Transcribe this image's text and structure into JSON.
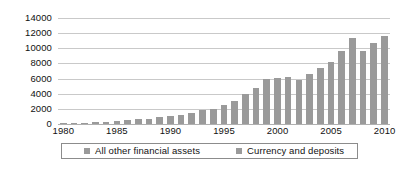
{
  "chart_data": {
    "type": "bar",
    "title": "",
    "subtitle": "",
    "xlabel": "",
    "ylabel": "",
    "ylim": [
      0,
      14000
    ],
    "y_ticks": [
      0,
      2000,
      4000,
      6000,
      8000,
      10000,
      12000,
      14000
    ],
    "x_tick_labels": [
      "1980",
      "1985",
      "1990",
      "1995",
      "2000",
      "2005",
      "2010"
    ],
    "x_tick_years": [
      1980,
      1985,
      1990,
      1995,
      2000,
      2005,
      2010
    ],
    "grid": true,
    "legend_position": "bottom",
    "legend": [
      "All other financial assets",
      "Currency and deposits"
    ],
    "categories": [
      "1980",
      "1981",
      "1982",
      "1983",
      "1984",
      "1985",
      "1986",
      "1987",
      "1988",
      "1989",
      "1990",
      "1991",
      "1992",
      "1993",
      "1994",
      "1995",
      "1996",
      "1997",
      "1998",
      "1999",
      "2000",
      "2001",
      "2002",
      "2003",
      "2004",
      "2005",
      "2006",
      "2007",
      "2008",
      "2009",
      "2010"
    ],
    "series": [
      {
        "name": "All other financial assets",
        "color": "#9a9a9a",
        "values": [
          60,
          120,
          170,
          230,
          300,
          380,
          560,
          640,
          700,
          950,
          1050,
          1250,
          1500,
          1900,
          2000,
          2450,
          3100,
          3900,
          4750,
          6000,
          6100,
          6200,
          5800,
          6650,
          7400,
          8250,
          9700,
          11400,
          9600,
          10750,
          11600
        ]
      }
    ],
    "bar_color": "#9a9a9a",
    "gridline_color": "#c9c9c9",
    "axis_color": "#b0b0b0",
    "background": "#ffffff"
  }
}
